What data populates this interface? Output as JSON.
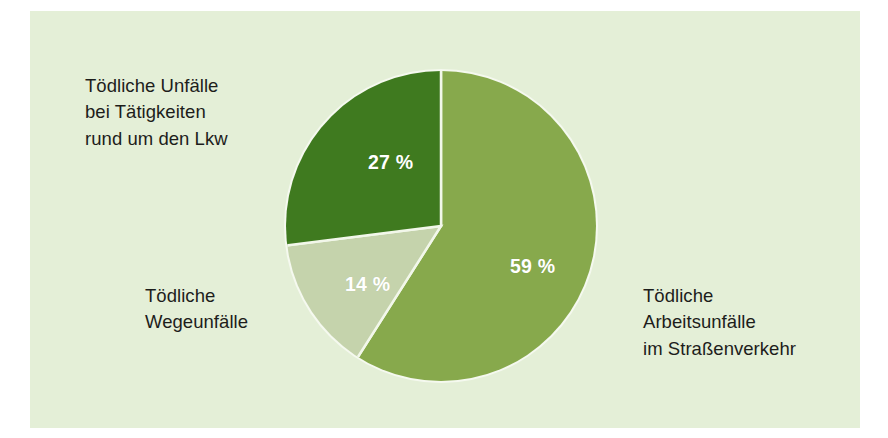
{
  "figure": {
    "background_color": "#e4efd7",
    "page_color": "#ffffff",
    "separator_color": "#f4f8ee"
  },
  "chart_data": {
    "type": "pie",
    "title": "",
    "subtitle": "",
    "xlabel": "",
    "ylabel": "",
    "legend_position": "around-pie-callouts",
    "grid": false,
    "units": "percent",
    "total": 100,
    "start_angle_deg": 0,
    "direction": "clockwise",
    "categories": [
      "Tödliche Arbeitsunfälle im Straßenverkehr",
      "Tödliche Wegeunfälle",
      "Tödliche Unfälle bei Tätigkeiten rund um den Lkw"
    ],
    "values": [
      59,
      14,
      27
    ],
    "value_labels": [
      "59 %",
      "14 %",
      "27 %"
    ],
    "colors": [
      "#87a94c",
      "#c5d3ac",
      "#3f7a1f"
    ],
    "slices": [
      {
        "id": "arbeitsunfaelle",
        "label": "Tödliche\nArbeitsunfälle\nim Straßenverkehr",
        "value": 59,
        "value_label": "59 %",
        "color": "#87a94c",
        "start_deg": 0,
        "sweep_deg": 212.4
      },
      {
        "id": "wegeunfaelle",
        "label": "Tödliche\nWegeunfälle",
        "value": 14,
        "value_label": "14 %",
        "color": "#c5d3ac",
        "start_deg": 212.4,
        "sweep_deg": 50.4
      },
      {
        "id": "lkw",
        "label": "Tödliche Unfälle\nbei Tätigkeiten\nrund um den Lkw",
        "value": 27,
        "value_label": "27 %",
        "color": "#3f7a1f",
        "start_deg": 262.8,
        "sweep_deg": 97.2
      }
    ]
  }
}
